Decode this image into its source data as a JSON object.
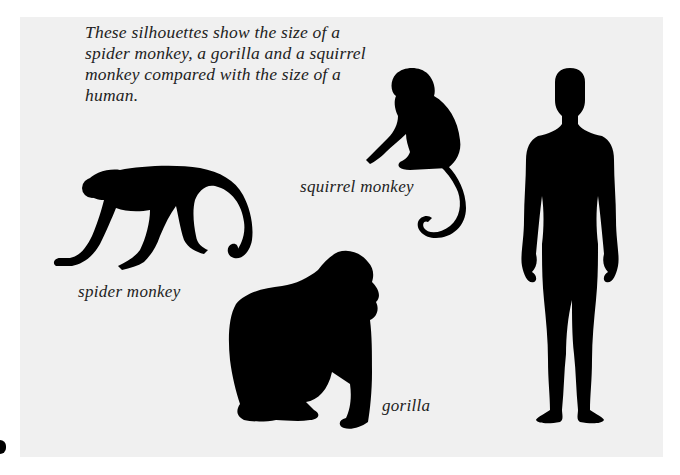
{
  "caption": "These silhouettes show the size of a spider monkey, a gorilla and a squirrel monkey compared with the size of a human.",
  "labels": {
    "spider_monkey": "spider monkey",
    "squirrel_monkey": "squirrel monkey",
    "gorilla": "gorilla"
  },
  "colors": {
    "background": "#f0f0f0",
    "silhouette": "#000000",
    "text": "#222222"
  }
}
